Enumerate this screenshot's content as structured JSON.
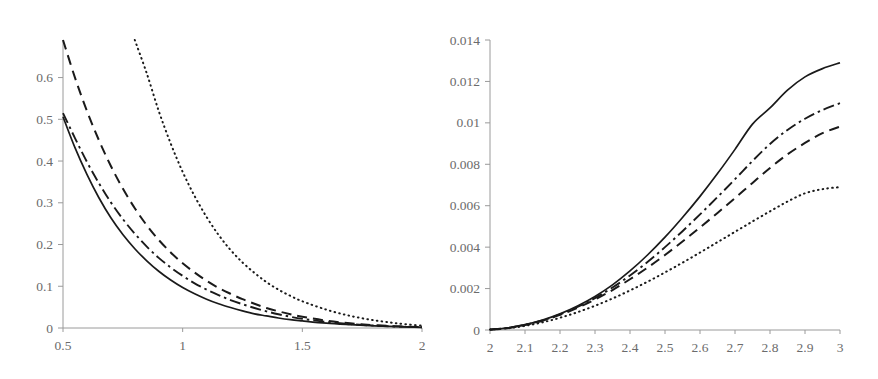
{
  "figure": {
    "background": "#ffffff",
    "curve_color": "#1a1a1a",
    "axis_color": "#9a9a9a",
    "tick_label_color": "#6b6b6b"
  },
  "chart_data": [
    {
      "panel": "left",
      "type": "line",
      "title": "",
      "xlabel": "",
      "ylabel": "",
      "xlim": [
        0.5,
        2
      ],
      "ylim": [
        0,
        0.69
      ],
      "grid": false,
      "legend": "none",
      "xticks": [
        0.5,
        1,
        1.5,
        2
      ],
      "xtick_labels": [
        "0.5",
        "1",
        "1.5",
        "2"
      ],
      "yticks": [
        0,
        0.1,
        0.2,
        0.3,
        0.4,
        0.5,
        0.6
      ],
      "ytick_labels": [
        "0",
        "0.1",
        "0.2",
        "0.3",
        "0.4",
        "0.5",
        "0.6"
      ],
      "x": [
        0.5,
        0.55,
        0.6,
        0.65,
        0.7,
        0.75,
        0.8,
        0.85,
        0.9,
        0.95,
        1.0,
        1.05,
        1.1,
        1.15,
        1.2,
        1.25,
        1.3,
        1.35,
        1.4,
        1.45,
        1.5,
        1.6,
        1.7,
        1.8,
        1.9,
        2.0
      ],
      "series": [
        {
          "name": "solid",
          "style": "solid",
          "values": [
            0.506,
            0.432,
            0.368,
            0.312,
            0.264,
            0.224,
            0.19,
            0.161,
            0.136,
            0.115,
            0.097,
            0.082,
            0.069,
            0.058,
            0.049,
            0.041,
            0.034,
            0.029,
            0.024,
            0.02,
            0.017,
            0.0115,
            0.008,
            0.0052,
            0.0032,
            0.0016
          ]
        },
        {
          "name": "dash-dot",
          "style": "dash-dot",
          "values": [
            0.515,
            0.455,
            0.398,
            0.347,
            0.301,
            0.261,
            0.226,
            0.195,
            0.168,
            0.145,
            0.125,
            0.107,
            0.092,
            0.079,
            0.067,
            0.057,
            0.048,
            0.04,
            0.033,
            0.027,
            0.022,
            0.0145,
            0.0093,
            0.0058,
            0.0034,
            0.0017
          ]
        },
        {
          "name": "dashed",
          "style": "dashed",
          "values": [
            0.69,
            0.6,
            0.52,
            0.45,
            0.388,
            0.334,
            0.287,
            0.246,
            0.211,
            0.181,
            0.155,
            0.133,
            0.113,
            0.096,
            0.082,
            0.069,
            0.058,
            0.048,
            0.04,
            0.033,
            0.027,
            0.0176,
            0.0111,
            0.0068,
            0.0039,
            0.0019
          ]
        },
        {
          "name": "dotted",
          "style": "dotted",
          "values": [
            null,
            null,
            null,
            null,
            null,
            null,
            0.7,
            0.61,
            0.52,
            0.442,
            0.374,
            0.316,
            0.266,
            0.223,
            0.187,
            0.157,
            0.132,
            0.11,
            0.092,
            0.077,
            0.064,
            0.044,
            0.029,
            0.0185,
            0.011,
            0.0055
          ]
        }
      ]
    },
    {
      "panel": "right",
      "type": "line",
      "title": "",
      "xlabel": "",
      "ylabel": "",
      "xlim": [
        2,
        3
      ],
      "ylim": [
        0,
        0.014
      ],
      "grid": false,
      "legend": "none",
      "xticks": [
        2,
        2.1,
        2.2,
        2.3,
        2.4,
        2.5,
        2.6,
        2.7,
        2.8,
        2.9,
        3
      ],
      "xtick_labels": [
        "2",
        "2.1",
        "2.2",
        "2.3",
        "2.4",
        "2.5",
        "2.6",
        "2.7",
        "2.8",
        "2.9",
        "3"
      ],
      "yticks": [
        0,
        0.002,
        0.004,
        0.006,
        0.008,
        0.01,
        0.012,
        0.014
      ],
      "ytick_labels": [
        "0",
        "0.002",
        "0.004",
        "0.006",
        "0.008",
        "0.01",
        "0.012",
        "0.014"
      ],
      "x": [
        2.0,
        2.05,
        2.1,
        2.15,
        2.2,
        2.25,
        2.3,
        2.35,
        2.4,
        2.45,
        2.5,
        2.55,
        2.6,
        2.65,
        2.7,
        2.75,
        2.8,
        2.85,
        2.9,
        2.95,
        3.0
      ],
      "series": [
        {
          "name": "solid",
          "style": "solid",
          "values": [
            2e-05,
            0.0001,
            0.00026,
            0.00048,
            0.00078,
            0.00116,
            0.00162,
            0.00218,
            0.00285,
            0.00362,
            0.00448,
            0.00543,
            0.00645,
            0.00755,
            0.00872,
            0.00994,
            0.01072,
            0.01158,
            0.01222,
            0.01262,
            0.0129
          ]
        },
        {
          "name": "dash-dot",
          "style": "dash-dot",
          "values": [
            2e-05,
            0.0001,
            0.00025,
            0.00046,
            0.00075,
            0.00111,
            0.00154,
            0.00205,
            0.00263,
            0.00328,
            0.004,
            0.00477,
            0.00558,
            0.00642,
            0.00728,
            0.00816,
            0.00898,
            0.00966,
            0.0102,
            0.01062,
            0.01095
          ]
        },
        {
          "name": "dashed",
          "style": "dashed",
          "values": [
            2e-05,
            9e-05,
            0.00024,
            0.00045,
            0.00073,
            0.00107,
            0.00147,
            0.00193,
            0.00245,
            0.00301,
            0.00362,
            0.00427,
            0.00495,
            0.00565,
            0.00637,
            0.0071,
            0.00782,
            0.00848,
            0.00903,
            0.0095,
            0.00982
          ]
        },
        {
          "name": "dotted",
          "style": "dotted",
          "values": [
            2e-05,
            8e-05,
            0.0002,
            0.00037,
            0.00059,
            0.00086,
            0.00117,
            0.00152,
            0.00191,
            0.00233,
            0.00278,
            0.00325,
            0.00374,
            0.00424,
            0.00474,
            0.00524,
            0.00573,
            0.0062,
            0.0066,
            0.0068,
            0.0069
          ]
        }
      ]
    }
  ]
}
